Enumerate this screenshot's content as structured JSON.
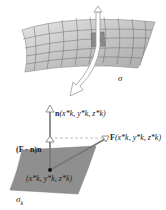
{
  "diagram": {
    "labels": {
      "sigma": "σ",
      "sigma_k": "σ",
      "sigma_k_sub": "k",
      "normal": "n(x*k, y*k, z*k)",
      "normal_bold": "n",
      "normal_args": "(x*k, y*k, z*k)",
      "field_bold": "F",
      "field_args": "(x*k, y*k, z*k)",
      "projection": "(F · n)n",
      "point": "(x*k, y*k, z*k)"
    },
    "colors": {
      "surface_top": "#c8c8c8",
      "surface_patch": "#8f8f8f",
      "grid": "#6a6a6a",
      "arrow": "#777777",
      "text": "#222222"
    }
  }
}
